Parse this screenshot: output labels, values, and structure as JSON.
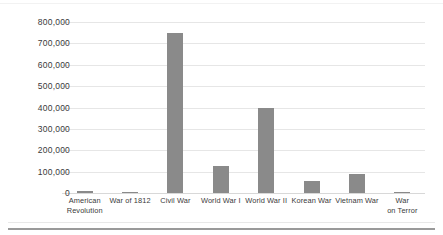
{
  "chart_data": {
    "type": "bar",
    "title": "",
    "subtitle": "",
    "xlabel": "",
    "ylabel": "",
    "categories": [
      "American Revolution",
      "War of 1812",
      "Civil War",
      "World War I",
      "World War II",
      "Korean War",
      "Vietnam War",
      "War on Terror"
    ],
    "category_lines": [
      [
        "American",
        "Revolution"
      ],
      [
        "War of 1812"
      ],
      [
        "Civil War"
      ],
      [
        "World War I"
      ],
      [
        "World War II"
      ],
      [
        "Korean War"
      ],
      [
        "Vietnam War"
      ],
      [
        "War",
        "on Terror"
      ]
    ],
    "values": [
      8000,
      2500,
      750000,
      125000,
      400000,
      55000,
      90000,
      7000
    ],
    "ylim": [
      0,
      800000
    ],
    "ytick_values": [
      0,
      100000,
      200000,
      300000,
      400000,
      500000,
      600000,
      700000,
      800000
    ],
    "ytick_labels": [
      "0",
      "100,000",
      "200,000",
      "300,000",
      "400,000",
      "500,000",
      "600,000",
      "700,000",
      "800,000"
    ],
    "grid": true,
    "grid_axis": "y",
    "legend": false,
    "legend_position": "none",
    "bar_color": "#8a8a8a",
    "gridline_color": "#e6e6e6",
    "background_color": "#ffffff",
    "text_color": "#3a3a3a"
  }
}
